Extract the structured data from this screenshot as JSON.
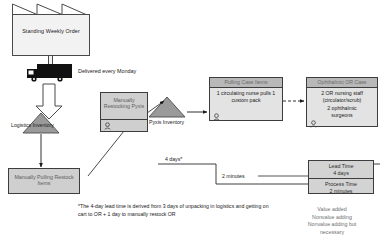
{
  "supplier": {
    "label": "Standing Weekly Order",
    "icon": "factory-sawtooth-icon"
  },
  "shipment": {
    "icon": "truck-icon",
    "note": "Delivered every Monday",
    "push_arrow_icon": "push-arrow-icon"
  },
  "inventories": [
    {
      "name": "logistics-inventory",
      "label": "Logistics Inventory",
      "icon": "inventory-triangle-icon"
    },
    {
      "name": "pyxis-inventory",
      "label": "Pyxis Inventory",
      "icon": "inventory-triangle-icon"
    }
  ],
  "processes": [
    {
      "name": "manually-pulling-restock-items",
      "title": "Manually Pulling Restock Items",
      "style": "simple"
    },
    {
      "name": "manually-restocking-pyxis",
      "title": "Manually Restocking Pyxis",
      "style": "simple",
      "operator_icon": "operator-icon"
    },
    {
      "name": "pulling-case-items",
      "title": "Pulling Case Items",
      "body": "1 circulating nurse pulls 1 custom pack",
      "operator_icon": "operator-icon"
    },
    {
      "name": "ophthalmic-or-case",
      "title": "Ophthalmic OR Case",
      "body_line1": "2 OR nursing staff",
      "body_line2": "(circulator/scrub)",
      "body_line3": "2 ophthalmic",
      "body_line4": "surgeons",
      "operator_icon": "operator-icon"
    }
  ],
  "timeline": {
    "lead_segment_label": "4 days*",
    "process_segment_label": "2 minutes"
  },
  "data_box": {
    "lead_time_label": "Lead Time",
    "lead_time_value": "4 days",
    "process_time_label": "Process Time",
    "process_time_value": "2 minutes"
  },
  "footnote": {
    "text": "*The 4-day lead time is derived  from 3 days of unpacking in logistics and getting on cart to OR  + 1 day to manually restock OR"
  },
  "legend": {
    "line1": "Value added",
    "line2": "Nonvalue adding",
    "line3": "Nonvalue adding but",
    "line4": "necessary"
  },
  "colors": {
    "process_header": "#b8b8b8",
    "process_body": "#e3e3e3",
    "simple_process": "#cfcfcf",
    "triangle": "#9a9a9a",
    "stroke": "#3d3d3d",
    "text": "#1a1a1a"
  }
}
